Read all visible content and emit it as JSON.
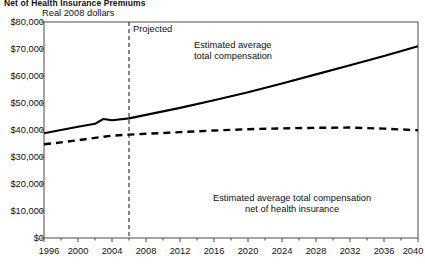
{
  "title": "Net of Health Insurance Premiums",
  "units_note": "Real 2008 dollars",
  "annotations": {
    "projected": "Projected",
    "total_line1": "Estimated average",
    "total_line2": "total compensation",
    "net_line1": "Estimated average total compensation",
    "net_line2": "net of health insurance"
  },
  "colors": {
    "ink": "#111111",
    "axis": "#4a4a4a",
    "series": "#000000"
  },
  "chart_data": {
    "type": "line",
    "title": "Net of Health Insurance Premiums",
    "subtitle": "Real 2008 dollars",
    "xlabel": "",
    "ylabel": "Real 2008 dollars",
    "xlim": [
      1996,
      2040
    ],
    "ylim": [
      0,
      80000
    ],
    "ytick_values": [
      0,
      10000,
      20000,
      30000,
      40000,
      50000,
      60000,
      70000,
      80000
    ],
    "ytick_labels": [
      "$0",
      "$10,000",
      "$20,000",
      "$30,000",
      "$40,000",
      "$50,000",
      "$60,000",
      "$70,000",
      "$80,000"
    ],
    "xtick_labels": [
      "1996",
      "2000",
      "2004",
      "2008",
      "2012",
      "2016",
      "2020",
      "2024",
      "2028",
      "2032",
      "2036",
      "2040"
    ],
    "xtick_values": [
      1996,
      2000,
      2004,
      2008,
      2012,
      2016,
      2020,
      2024,
      2028,
      2032,
      2036,
      2040
    ],
    "xminor_step": 2,
    "grid": false,
    "legend": "inline-annotations",
    "projection_divider_year": 2006,
    "projection_divider_label": "Projected",
    "series": [
      {
        "name": "Estimated average total compensation",
        "style": "solid",
        "x": [
          1996,
          1998,
          2000,
          2002,
          2003,
          2004,
          2006,
          2008,
          2012,
          2016,
          2020,
          2024,
          2028,
          2032,
          2036,
          2040
        ],
        "values": [
          38800,
          40000,
          41200,
          42300,
          44100,
          43600,
          44300,
          45600,
          48200,
          51000,
          54000,
          57200,
          60600,
          64000,
          67400,
          71000
        ]
      },
      {
        "name": "Estimated average total compensation net of health insurance",
        "style": "dashed",
        "x": [
          1996,
          1998,
          2000,
          2002,
          2004,
          2006,
          2008,
          2012,
          2016,
          2020,
          2024,
          2028,
          2032,
          2036,
          2040
        ],
        "values": [
          34700,
          35400,
          36200,
          37100,
          37900,
          38300,
          38600,
          39200,
          39800,
          40300,
          40600,
          40800,
          40900,
          40500,
          39900
        ]
      }
    ]
  }
}
